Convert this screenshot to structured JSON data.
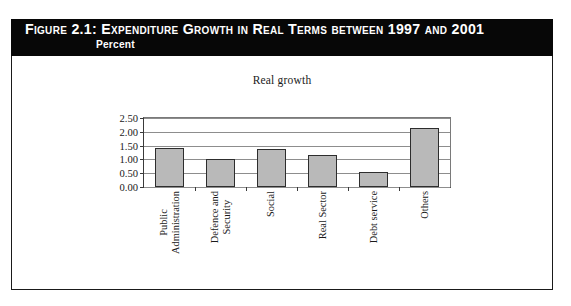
{
  "figure": {
    "banner_title": "Figure 2.1:  Expenditure Growth in Real Terms between 1997 and 2001",
    "banner_subtitle": "Percent",
    "banner_bg": "#070707",
    "banner_fg": "#ffffff",
    "frame_color": "#1a1a1a"
  },
  "chart_data": {
    "type": "bar",
    "title": "Real growth",
    "xlabel": "",
    "ylabel": "",
    "ylim": [
      0.0,
      2.5
    ],
    "yticks": [
      "0.00",
      "0.50",
      "1.00",
      "1.50",
      "2.00",
      "2.50"
    ],
    "ytick_values": [
      0.0,
      0.5,
      1.0,
      1.5,
      2.0,
      2.5
    ],
    "grid": true,
    "legend": false,
    "bar_fill": "#b9b9b9",
    "bar_border": "#2d2d2d",
    "categories": [
      "Public Administration",
      "Defence and Security",
      "Social",
      "Real Sector",
      "Debt service",
      "Others"
    ],
    "category_lines": [
      [
        "Public",
        "Administration"
      ],
      [
        "Defence and",
        "Security"
      ],
      [
        "Social",
        ""
      ],
      [
        "Real Sector",
        ""
      ],
      [
        "Debt service",
        ""
      ],
      [
        "Others",
        ""
      ]
    ],
    "values": [
      1.41,
      1.02,
      1.37,
      1.16,
      0.56,
      2.15
    ]
  }
}
